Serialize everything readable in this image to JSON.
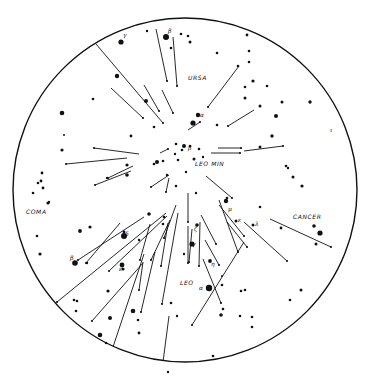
{
  "figure": {
    "title": "",
    "circle": {
      "cx": 185,
      "cy": 190,
      "r": 172,
      "stroke": "#111111"
    },
    "ink_color": "#111111",
    "background": "#ffffff"
  },
  "labels": [
    {
      "id": "ursa",
      "text": "URSA",
      "x": 188,
      "y": 80
    },
    {
      "id": "leo-min",
      "text": "LEO MIN",
      "x": 195,
      "y": 166
    },
    {
      "id": "coma",
      "text": "COMA",
      "x": 26,
      "y": 214
    },
    {
      "id": "cancer",
      "text": "CANCER",
      "x": 293,
      "y": 219
    },
    {
      "id": "leo",
      "text": "LEO",
      "x": 180,
      "y": 285
    }
  ],
  "greek_letters": [
    {
      "text": "γ",
      "x": 123,
      "y": 37
    },
    {
      "text": "β",
      "x": 168,
      "y": 33
    },
    {
      "text": "α",
      "x": 200,
      "y": 117
    },
    {
      "text": "β",
      "x": 188,
      "y": 150
    },
    {
      "text": "δ",
      "x": 125,
      "y": 236
    },
    {
      "text": "β",
      "x": 70,
      "y": 260
    },
    {
      "text": "ε",
      "x": 119,
      "y": 271
    },
    {
      "text": "ζ",
      "x": 194,
      "y": 231
    },
    {
      "text": "γ",
      "x": 192,
      "y": 246
    },
    {
      "text": "μ",
      "x": 228,
      "y": 211
    },
    {
      "text": "ε",
      "x": 238,
      "y": 222
    },
    {
      "text": "λ",
      "x": 255,
      "y": 226
    },
    {
      "text": "η",
      "x": 211,
      "y": 266
    },
    {
      "text": "α",
      "x": 199,
      "y": 290
    },
    {
      "text": "ι",
      "x": 330,
      "y": 132
    }
  ],
  "stars": [
    [
      121,
      42,
      2.6
    ],
    [
      147,
      31,
      1.2
    ],
    [
      166,
      37,
      3.0
    ],
    [
      171,
      48,
      1.3
    ],
    [
      181,
      34,
      1.3
    ],
    [
      188,
      36,
      1.3
    ],
    [
      190,
      42,
      1.5
    ],
    [
      117,
      76,
      2.2
    ],
    [
      93,
      99,
      1.3
    ],
    [
      62,
      113,
      2.3
    ],
    [
      146,
      101,
      2.0
    ],
    [
      64,
      135,
      1.0
    ],
    [
      131,
      136,
      1.4
    ],
    [
      62,
      150,
      1.6
    ],
    [
      154,
      127,
      1.3
    ],
    [
      176,
      144,
      1.3
    ],
    [
      182,
      150,
      1.3
    ],
    [
      157,
      162,
      2.0
    ],
    [
      175,
      154,
      1.2
    ],
    [
      178,
      160,
      1.3
    ],
    [
      190,
      146,
      1.3
    ],
    [
      184,
      146,
      2.0
    ],
    [
      199,
      149,
      1.3
    ],
    [
      194,
      159,
      1.5
    ],
    [
      203,
      157,
      1.2
    ],
    [
      186,
      172,
      1.2
    ],
    [
      167,
      175,
      1.2
    ],
    [
      163,
      161,
      1.3
    ],
    [
      154,
      164,
      1.3
    ],
    [
      127,
      165,
      1.6
    ],
    [
      127,
      175,
      1.8
    ],
    [
      107,
      178,
      1.2
    ],
    [
      42,
      173,
      1.4
    ],
    [
      41,
      181,
      1.4
    ],
    [
      38,
      183,
      1.3
    ],
    [
      43,
      188,
      1.4
    ],
    [
      33,
      193,
      1.3
    ],
    [
      48,
      203,
      1.6
    ],
    [
      247,
      35,
      1.4
    ],
    [
      249,
      51,
      1.3
    ],
    [
      217,
      53,
      1.3
    ],
    [
      249,
      62,
      1.3
    ],
    [
      238,
      66,
      1.3
    ],
    [
      253,
      81,
      1.6
    ],
    [
      267,
      86,
      1.3
    ],
    [
      245,
      87,
      1.3
    ],
    [
      245,
      98,
      1.5
    ],
    [
      282,
      102,
      1.5
    ],
    [
      260,
      106,
      1.5
    ],
    [
      276,
      116,
      2.0
    ],
    [
      198,
      115,
      2.2
    ],
    [
      193,
      123,
      2.6
    ],
    [
      217,
      125,
      1.3
    ],
    [
      310,
      102,
      1.7
    ],
    [
      272,
      136,
      1.7
    ],
    [
      260,
      147,
      1.5
    ],
    [
      286,
      166,
      1.3
    ],
    [
      288,
      168,
      1.2
    ],
    [
      293,
      177,
      1.5
    ],
    [
      302,
      186,
      1.6
    ],
    [
      176,
      186,
      1.3
    ],
    [
      196,
      193,
      1.2
    ],
    [
      49,
      202,
      1.2
    ],
    [
      37,
      236,
      1.3
    ],
    [
      40,
      254,
      1.6
    ],
    [
      80,
      231,
      1.9
    ],
    [
      90,
      227,
      1.6
    ],
    [
      124,
      232,
      1.4
    ],
    [
      124,
      236,
      3.0
    ],
    [
      139,
      240,
      1.2
    ],
    [
      149,
      214,
      1.8
    ],
    [
      164,
      217,
      1.3
    ],
    [
      163,
      224,
      1.3
    ],
    [
      75,
      263,
      2.8
    ],
    [
      87,
      263,
      1.2
    ],
    [
      123,
      269,
      1.6
    ],
    [
      122,
      265,
      2.4
    ],
    [
      108,
      291,
      1.6
    ],
    [
      74,
      300,
      1.3
    ],
    [
      77,
      301,
      1.3
    ],
    [
      76,
      311,
      1.3
    ],
    [
      110,
      318,
      2.0
    ],
    [
      133,
      311,
      2.3
    ],
    [
      138,
      320,
      1.3
    ],
    [
      100,
      335,
      2.3
    ],
    [
      139,
      333,
      1.4
    ],
    [
      106,
      343,
      1.2
    ],
    [
      171,
      303,
      1.3
    ],
    [
      177,
      316,
      1.2
    ],
    [
      226,
      201,
      2.2
    ],
    [
      227,
      198,
      1.3
    ],
    [
      236,
      221,
      1.5
    ],
    [
      253,
      225,
      1.5
    ],
    [
      197,
      225,
      1.8
    ],
    [
      192,
      244,
      2.6
    ],
    [
      210,
      261,
      1.9
    ],
    [
      209,
      287,
      1.2
    ],
    [
      209,
      288,
      3.2
    ],
    [
      222,
      285,
      1.3
    ],
    [
      245,
      290,
      1.3
    ],
    [
      223,
      309,
      1.3
    ],
    [
      221,
      315,
      1.8
    ],
    [
      240,
      316,
      1.3
    ],
    [
      252,
      317,
      1.3
    ],
    [
      252,
      327,
      1.3
    ],
    [
      260,
      207,
      1.3
    ],
    [
      281,
      228,
      1.4
    ],
    [
      314,
      226,
      1.8
    ],
    [
      320,
      233,
      2.6
    ],
    [
      316,
      244,
      1.5
    ],
    [
      301,
      290,
      1.5
    ],
    [
      290,
      300,
      1.3
    ],
    [
      213,
      356,
      1.3
    ],
    [
      241,
      291,
      1.3
    ],
    [
      222,
      276,
      1.0
    ],
    [
      184,
      254,
      1.2
    ],
    [
      168,
      372,
      1.2
    ]
  ],
  "meteors": [
    {
      "x1": 96,
      "y1": 44,
      "x2": 163,
      "y2": 123
    },
    {
      "x1": 156,
      "y1": 29,
      "x2": 167,
      "y2": 81
    },
    {
      "x1": 173,
      "y1": 37,
      "x2": 177,
      "y2": 86
    },
    {
      "x1": 111,
      "y1": 88,
      "x2": 143,
      "y2": 118
    },
    {
      "x1": 144,
      "y1": 85,
      "x2": 159,
      "y2": 111
    },
    {
      "x1": 162,
      "y1": 90,
      "x2": 173,
      "y2": 113
    },
    {
      "x1": 239,
      "y1": 66,
      "x2": 208,
      "y2": 107
    },
    {
      "x1": 254,
      "y1": 110,
      "x2": 228,
      "y2": 126
    },
    {
      "x1": 188,
      "y1": 130,
      "x2": 200,
      "y2": 122
    },
    {
      "x1": 139,
      "y1": 154,
      "x2": 94,
      "y2": 148
    },
    {
      "x1": 127,
      "y1": 158,
      "x2": 66,
      "y2": 164
    },
    {
      "x1": 160,
      "y1": 153,
      "x2": 168,
      "y2": 149
    },
    {
      "x1": 218,
      "y1": 148,
      "x2": 241,
      "y2": 148
    },
    {
      "x1": 211,
      "y1": 153,
      "x2": 240,
      "y2": 153
    },
    {
      "x1": 244,
      "y1": 151,
      "x2": 283,
      "y2": 146
    },
    {
      "x1": 133,
      "y1": 166,
      "x2": 108,
      "y2": 178
    },
    {
      "x1": 169,
      "y1": 175,
      "x2": 151,
      "y2": 187
    },
    {
      "x1": 131,
      "y1": 171,
      "x2": 95,
      "y2": 185
    },
    {
      "x1": 169,
      "y1": 178,
      "x2": 166,
      "y2": 192
    },
    {
      "x1": 206,
      "y1": 176,
      "x2": 232,
      "y2": 198
    },
    {
      "x1": 144,
      "y1": 217,
      "x2": 78,
      "y2": 260
    },
    {
      "x1": 120,
      "y1": 223,
      "x2": 86,
      "y2": 263
    },
    {
      "x1": 166,
      "y1": 213,
      "x2": 57,
      "y2": 302
    },
    {
      "x1": 167,
      "y1": 216,
      "x2": 109,
      "y2": 271
    },
    {
      "x1": 176,
      "y1": 205,
      "x2": 164,
      "y2": 238
    },
    {
      "x1": 170,
      "y1": 220,
      "x2": 151,
      "y2": 260
    },
    {
      "x1": 143,
      "y1": 263,
      "x2": 92,
      "y2": 321
    },
    {
      "x1": 144,
      "y1": 254,
      "x2": 113,
      "y2": 347
    },
    {
      "x1": 155,
      "y1": 252,
      "x2": 141,
      "y2": 312
    },
    {
      "x1": 143,
      "y1": 262,
      "x2": 139,
      "y2": 290
    },
    {
      "x1": 168,
      "y1": 223,
      "x2": 161,
      "y2": 266
    },
    {
      "x1": 150,
      "y1": 224,
      "x2": 140,
      "y2": 260
    },
    {
      "x1": 178,
      "y1": 213,
      "x2": 162,
      "y2": 304
    },
    {
      "x1": 188,
      "y1": 193,
      "x2": 188,
      "y2": 222
    },
    {
      "x1": 188,
      "y1": 226,
      "x2": 188,
      "y2": 263
    },
    {
      "x1": 200,
      "y1": 222,
      "x2": 199,
      "y2": 266
    },
    {
      "x1": 192,
      "y1": 229,
      "x2": 189,
      "y2": 262
    },
    {
      "x1": 169,
      "y1": 316,
      "x2": 163,
      "y2": 362
    },
    {
      "x1": 201,
      "y1": 215,
      "x2": 216,
      "y2": 244
    },
    {
      "x1": 205,
      "y1": 240,
      "x2": 219,
      "y2": 265
    },
    {
      "x1": 219,
      "y1": 200,
      "x2": 238,
      "y2": 252
    },
    {
      "x1": 219,
      "y1": 205,
      "x2": 244,
      "y2": 236
    },
    {
      "x1": 227,
      "y1": 222,
      "x2": 247,
      "y2": 247
    },
    {
      "x1": 203,
      "y1": 259,
      "x2": 221,
      "y2": 303
    },
    {
      "x1": 244,
      "y1": 242,
      "x2": 192,
      "y2": 325
    },
    {
      "x1": 244,
      "y1": 222,
      "x2": 287,
      "y2": 261
    },
    {
      "x1": 270,
      "y1": 219,
      "x2": 331,
      "y2": 247
    }
  ]
}
